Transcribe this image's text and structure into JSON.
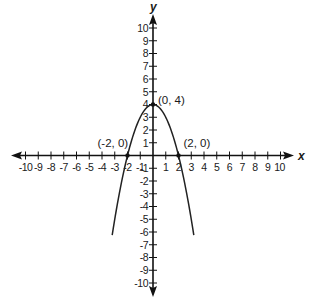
{
  "chart_data": {
    "type": "line",
    "title": "",
    "xlabel": "x",
    "ylabel": "y",
    "xlim": [
      -10,
      10
    ],
    "ylim": [
      -10,
      10
    ],
    "grid": false,
    "function": "y = 4 - x^2",
    "x_ticks": [
      -10,
      -9,
      -8,
      -7,
      -6,
      -5,
      -4,
      -3,
      -2,
      -1,
      1,
      2,
      3,
      4,
      5,
      6,
      7,
      8,
      9,
      10
    ],
    "y_ticks": [
      -10,
      -9,
      -8,
      -7,
      -6,
      -5,
      -4,
      -3,
      -2,
      -1,
      1,
      2,
      3,
      4,
      5,
      6,
      7,
      8,
      9,
      10
    ],
    "series": [
      {
        "name": "parabola",
        "x": [
          -3.2,
          -3,
          -2.5,
          -2,
          -1.5,
          -1,
          -0.5,
          0,
          0.5,
          1,
          1.5,
          2,
          2.5,
          3,
          3.2
        ],
        "y": [
          -6.24,
          -5,
          -2.25,
          0,
          1.75,
          3,
          3.75,
          4,
          3.75,
          3,
          1.75,
          0,
          -2.25,
          -5,
          -6.24
        ]
      }
    ],
    "annotations": [
      {
        "text": "(-2, 0)",
        "x": -2,
        "y": 0
      },
      {
        "text": "(0, 4)",
        "x": 0,
        "y": 4
      },
      {
        "text": "(2, 0)",
        "x": 2,
        "y": 0
      }
    ],
    "colors": {
      "axis": "#111111",
      "curve": "#222222",
      "text": "#1a1a1a"
    }
  }
}
